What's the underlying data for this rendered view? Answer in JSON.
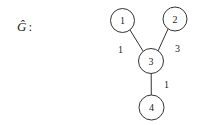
{
  "graph": {
    "label": "Ĝ",
    "label_suffix": ":",
    "nodes": [
      {
        "id": "1",
        "label": "1",
        "x": 122.5,
        "y": 20.5,
        "r": 12
      },
      {
        "id": "2",
        "label": "2",
        "x": 175,
        "y": 19,
        "r": 12
      },
      {
        "id": "3",
        "label": "3",
        "x": 151,
        "y": 61,
        "r": 12.5
      },
      {
        "id": "4",
        "label": "4",
        "x": 151.5,
        "y": 107.5,
        "r": 12.5
      }
    ],
    "edges": [
      {
        "from": "1",
        "to": "3",
        "weight": "1"
      },
      {
        "from": "2",
        "to": "3",
        "weight": "3"
      },
      {
        "from": "3",
        "to": "4",
        "weight": "1"
      }
    ]
  },
  "colors": {
    "stroke": "#333333",
    "text": "#222222"
  }
}
